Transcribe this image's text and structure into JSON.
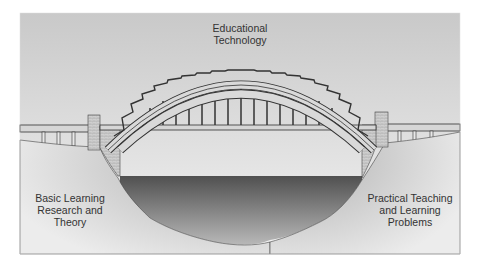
{
  "diagram": {
    "type": "metaphor-illustration",
    "labels": {
      "top": [
        "Educational",
        "Technology"
      ],
      "left": [
        "Basic Learning",
        "Research and",
        "Theory"
      ],
      "right": [
        "Practical Teaching",
        "and Learning",
        "Problems"
      ]
    },
    "colors": {
      "sky_top": "#c8c8c8",
      "sky_bottom": "#f2f2f2",
      "ground_light": "#e6e6e6",
      "ground_dark": "#8c8c8c",
      "water_top": "#555555",
      "water_bottom": "#b5b5b5",
      "structure_fill": "#d9d9d9",
      "structure_stroke": "#333333",
      "text": "#333333"
    }
  }
}
